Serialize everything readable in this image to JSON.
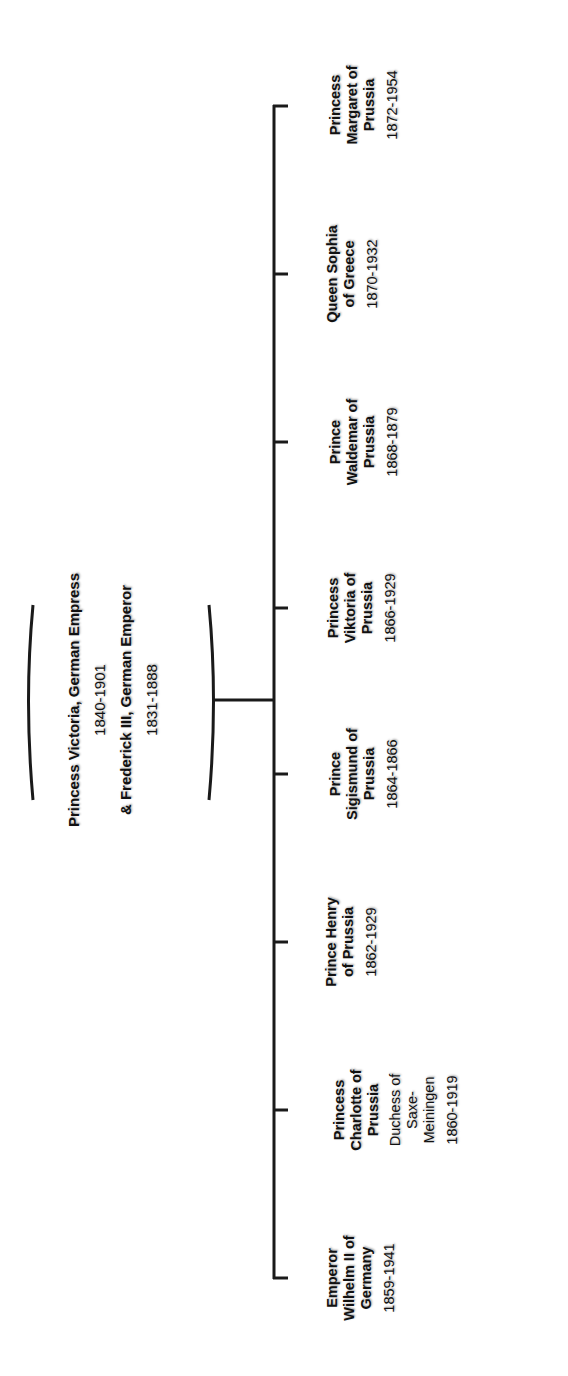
{
  "parents": {
    "mother_name": "Princess Victoria, German Empress",
    "mother_dates": "1840-1901",
    "father_name": "& Frederick III, German Emperor",
    "father_dates": "1831-1888"
  },
  "children": [
    {
      "name_lines": [
        "Princess",
        "Margaret of",
        "Prussia"
      ],
      "dates": "1872-1954"
    },
    {
      "name_lines": [
        "Queen Sophia",
        "of Greece"
      ],
      "dates": "1870-1932"
    },
    {
      "name_lines": [
        "Prince",
        "Waldemar of",
        "Prussia"
      ],
      "dates": "1868-1879"
    },
    {
      "name_lines": [
        "Princess",
        "Viktoria of",
        "Prussia"
      ],
      "dates": "1866-1929"
    },
    {
      "name_lines": [
        "Prince",
        "Sigismund of",
        "Prussia"
      ],
      "dates": "1864-1866"
    },
    {
      "name_lines": [
        "Prince Henry",
        "of Prussia"
      ],
      "dates": "1862-1929"
    },
    {
      "name_lines": [
        "Princess",
        "Charlotte of",
        "Prussia"
      ],
      "title_lines": [
        "Duchess of",
        "Saxe-",
        "Meiningen"
      ],
      "dates": "1860-1919"
    },
    {
      "name_lines": [
        "Emperor",
        "Wilhelm II of",
        "Germany"
      ],
      "dates": "1859-1941"
    }
  ],
  "colors": {
    "line": "#1a1a1a",
    "text": "#111111",
    "background": "#ffffff"
  }
}
